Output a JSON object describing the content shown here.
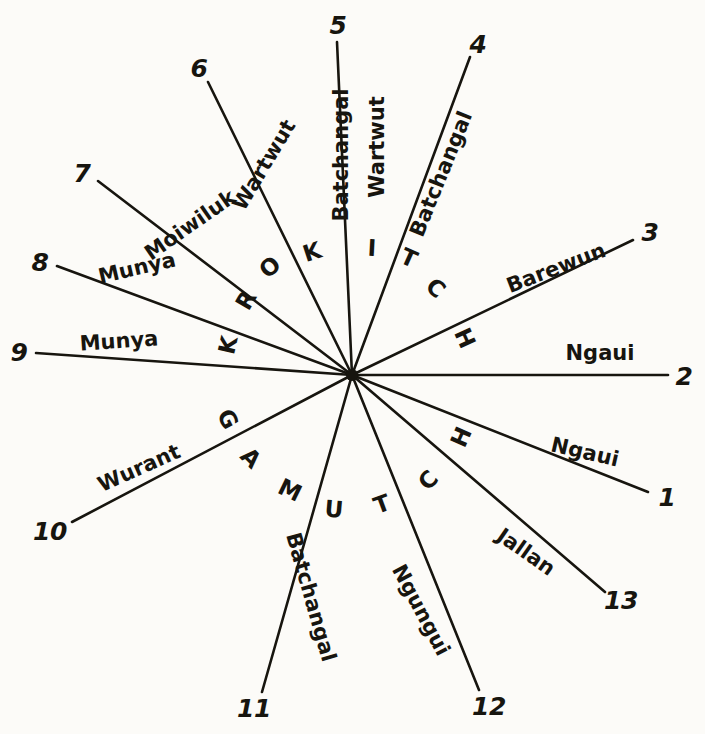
{
  "figure": {
    "type": "radial-direction-diagram",
    "background_color": "#fcfbf8",
    "ink_color": "#17150f",
    "center": {
      "x": 352,
      "y": 375
    },
    "ray_count": 13
  },
  "rays": [
    {
      "number": "1",
      "name": "Ngaui",
      "num_pos": {
        "x": 667,
        "y": 497
      },
      "end": {
        "x": 648,
        "y": 492
      },
      "name_pos": {
        "x": 585,
        "y": 452
      },
      "name_rotation": 13
    },
    {
      "number": "2",
      "name": "Ngaui",
      "num_pos": {
        "x": 684,
        "y": 376
      },
      "end": {
        "x": 668,
        "y": 375
      },
      "name_pos": {
        "x": 600,
        "y": 353
      },
      "name_rotation": 0
    },
    {
      "number": "3",
      "name": "Barewun",
      "num_pos": {
        "x": 650,
        "y": 232
      },
      "end": {
        "x": 633,
        "y": 240
      },
      "name_pos": {
        "x": 556,
        "y": 268
      },
      "name_rotation": -21
    },
    {
      "number": "4",
      "name": "Batchangal",
      "num_pos": {
        "x": 478,
        "y": 44
      },
      "end": {
        "x": 470,
        "y": 57
      },
      "name_pos": {
        "x": 441,
        "y": 174
      },
      "name_rotation": -68
    },
    {
      "number": "5",
      "name": "Wartwut",
      "secondary_name": "Batchangal",
      "num_pos": {
        "x": 338,
        "y": 25
      },
      "end": {
        "x": 337,
        "y": 42
      },
      "name_pos": {
        "x": 377,
        "y": 147
      },
      "name_rotation": -90,
      "secondary_name_pos": {
        "x": 341,
        "y": 155
      },
      "secondary_name_rotation": -90
    },
    {
      "number": "6",
      "name": "Wartwut",
      "num_pos": {
        "x": 199,
        "y": 68
      },
      "end": {
        "x": 208,
        "y": 82
      },
      "name_pos": {
        "x": 264,
        "y": 165
      },
      "name_rotation": -59
    },
    {
      "number": "7",
      "name": "Moiwiluk",
      "num_pos": {
        "x": 82,
        "y": 173
      },
      "end": {
        "x": 98,
        "y": 181
      },
      "name_pos": {
        "x": 190,
        "y": 225
      },
      "name_rotation": -35
    },
    {
      "number": "8",
      "name": "Munya",
      "num_pos": {
        "x": 40,
        "y": 262
      },
      "end": {
        "x": 57,
        "y": 266
      },
      "name_pos": {
        "x": 137,
        "y": 268
      },
      "name_rotation": -13
    },
    {
      "number": "9",
      "name": "Munya",
      "num_pos": {
        "x": 19,
        "y": 352
      },
      "end": {
        "x": 36,
        "y": 353
      },
      "name_pos": {
        "x": 119,
        "y": 341
      },
      "name_rotation": -4
    },
    {
      "number": "10",
      "name": "Wurant",
      "num_pos": {
        "x": 50,
        "y": 531
      },
      "end": {
        "x": 72,
        "y": 522
      },
      "name_pos": {
        "x": 139,
        "y": 468
      },
      "name_rotation": -24
    },
    {
      "number": "11",
      "name": "Batchangal",
      "num_pos": {
        "x": 254,
        "y": 708
      },
      "end": {
        "x": 262,
        "y": 692
      },
      "name_pos": {
        "x": 311,
        "y": 597
      },
      "name_rotation": 74
    },
    {
      "number": "12",
      "name": "Ngungui",
      "num_pos": {
        "x": 489,
        "y": 706
      },
      "end": {
        "x": 479,
        "y": 690
      },
      "name_pos": {
        "x": 421,
        "y": 610
      },
      "name_rotation": 62
    },
    {
      "number": "13",
      "name": "Jallan",
      "num_pos": {
        "x": 621,
        "y": 600
      },
      "end": {
        "x": 605,
        "y": 592
      },
      "name_pos": {
        "x": 526,
        "y": 552
      },
      "name_rotation": 35
    }
  ],
  "spoke_letters": [
    {
      "char": "K",
      "x": 228,
      "y": 345,
      "rotation": -77
    },
    {
      "char": "R",
      "x": 246,
      "y": 300,
      "rotation": -60
    },
    {
      "char": "O",
      "x": 270,
      "y": 267,
      "rotation": -41
    },
    {
      "char": "K",
      "x": 312,
      "y": 252,
      "rotation": -18
    },
    {
      "char": "I",
      "x": 372,
      "y": 248,
      "rotation": 3
    },
    {
      "char": "T",
      "x": 409,
      "y": 258,
      "rotation": 24
    },
    {
      "char": "C",
      "x": 436,
      "y": 288,
      "rotation": 42
    },
    {
      "char": "H",
      "x": 465,
      "y": 338,
      "rotation": 66
    },
    {
      "char": "H",
      "x": 461,
      "y": 437,
      "rotation": -66
    },
    {
      "char": "C",
      "x": 428,
      "y": 480,
      "rotation": -45
    },
    {
      "char": "T",
      "x": 382,
      "y": 504,
      "rotation": -20
    },
    {
      "char": "U",
      "x": 334,
      "y": 509,
      "rotation": 5
    },
    {
      "char": "M",
      "x": 290,
      "y": 490,
      "rotation": 26
    },
    {
      "char": "A",
      "x": 251,
      "y": 458,
      "rotation": 45
    },
    {
      "char": "G",
      "x": 228,
      "y": 419,
      "rotation": 63
    }
  ]
}
